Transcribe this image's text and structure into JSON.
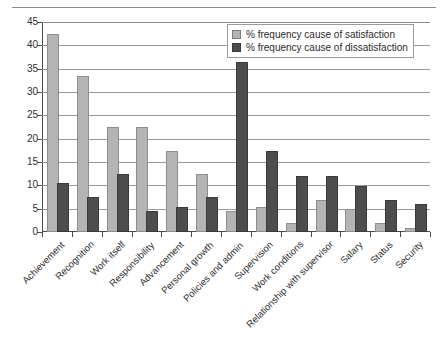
{
  "chart_data": {
    "type": "bar",
    "title": "",
    "xlabel": "",
    "ylabel": "",
    "ylim": [
      0,
      45
    ],
    "ytick_step": 5,
    "yticks": [
      0,
      5,
      10,
      15,
      20,
      25,
      30,
      35,
      40,
      45
    ],
    "grid": true,
    "legend_position": "top-right",
    "categories": [
      "Achievement",
      "Recognition",
      "Work itself",
      "Responsibility",
      "Advancement",
      "Personal growth",
      "Policies and admin",
      "Supervision",
      "Work conditions",
      "Relationship with supervisor",
      "Salary",
      "Status",
      "Security"
    ],
    "series": [
      {
        "name": "% frequency cause of satisfaction",
        "color": "#b4b4b4",
        "values": [
          42,
          33,
          22,
          22,
          17,
          12,
          4,
          5,
          1.5,
          6.5,
          4.5,
          1.5,
          0.5
        ]
      },
      {
        "name": "% frequency cause of dissatisfaction",
        "color": "#4d4d4d",
        "values": [
          10,
          7,
          12,
          4,
          5,
          7,
          36,
          17,
          11.5,
          11.5,
          9.5,
          6.5,
          5.5
        ]
      }
    ]
  },
  "legend": {
    "items": [
      {
        "label": "% frequency cause of satisfaction",
        "swatch": "light"
      },
      {
        "label": "% frequency cause of dissatisfaction",
        "swatch": "dark"
      }
    ]
  }
}
